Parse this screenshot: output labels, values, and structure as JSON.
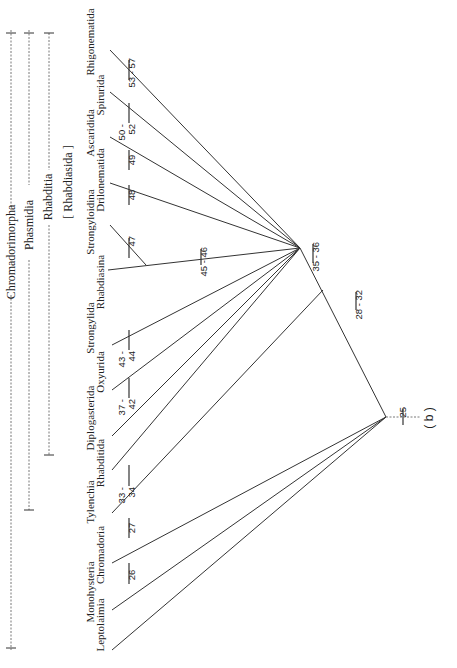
{
  "figure": {
    "panel_label": "( b )",
    "orientation": "rotated -90deg (read with page turned clockwise)"
  },
  "groups": [
    {
      "label": "Chromadorimorpha",
      "type": "dashed-bracket"
    },
    {
      "label": "Phasmidia",
      "type": "dashed-bracket"
    },
    {
      "label": "Rhabditia",
      "type": "dashed-bracket"
    },
    {
      "label": "[ Rhabdiasida ]",
      "type": "bracketed-label"
    }
  ],
  "taxa": [
    {
      "name": "Leptolaimia",
      "apomorphies": ""
    },
    {
      "name": "Monohysteria",
      "apomorphies": "26"
    },
    {
      "name": "Chromadoria",
      "apomorphies": "27"
    },
    {
      "name": "Tylenchia",
      "apomorphies": "33 - 34"
    },
    {
      "name": "Rhabditida",
      "apomorphies": ""
    },
    {
      "name": "Diplogasterida",
      "apomorphies": ""
    },
    {
      "name": "Oxyurida",
      "apomorphies": "37 - 42"
    },
    {
      "name": "Strongylida",
      "apomorphies": "43 - 44"
    },
    {
      "name": "Rhabdiasina",
      "apomorphies": ""
    },
    {
      "name": "Strongyloidina",
      "apomorphies": "47"
    },
    {
      "name": "Drilonematida",
      "apomorphies": "48"
    },
    {
      "name": "Ascaridida",
      "apomorphies": "49"
    },
    {
      "name": "Spirurida",
      "apomorphies": "50 - 52"
    },
    {
      "name": "Rhigonematida",
      "apomorphies": "53 - 57"
    }
  ],
  "nodes": {
    "root": {
      "apomorphies": "25"
    },
    "stem_phasmidia": {
      "apomorphies": "28 - 32"
    },
    "rhabditia_node": {
      "apomorphies": "35 - 36"
    },
    "rhabdiasida_node": {
      "apomorphies": "45 - 46"
    }
  },
  "labels": {
    "t0": "Leptolaimia",
    "t1": "Monohysteria",
    "t2": "Chromadoria",
    "t3": "Tylenchia",
    "t4": "Rhabditida",
    "t5": "Diplogasterida",
    "t6": "Oxyurida",
    "t7": "Strongylida",
    "t8": "Rhabdiasina",
    "t9": "Strongyloidina",
    "t10": "Drilonematida",
    "t11": "Ascaridida",
    "t12": "Spirurida",
    "t13": "Rhigonematida",
    "n26": "26",
    "n27": "27",
    "n33a": "33 -",
    "n33b": "34",
    "n37a": "37 -",
    "n37b": "42",
    "n43a": "43 -",
    "n43b": "44",
    "n47": "47",
    "n48": "48",
    "n49": "49",
    "n50a": "50 -",
    "n50b": "52",
    "n53": "53 - 57",
    "n45": "45 - 46",
    "n35": "35 - 36",
    "n28": "28 - 32",
    "n25": "25",
    "g_chrom": "Chromadorimorpha",
    "g_phas": "Phasmidia",
    "g_rhab": "Rhabditia",
    "g_rhabd": "[ Rhabdiasida ]",
    "panel": "( b )"
  }
}
